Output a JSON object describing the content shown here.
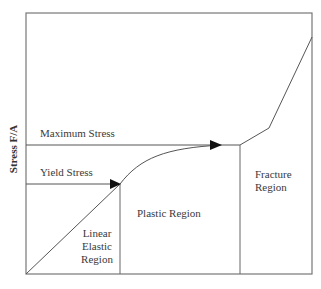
{
  "diagram": {
    "y_axis_label": "Stress  F/A",
    "labels": {
      "maximum_stress": "Maximum Stress",
      "yield_stress": "Yield Stress",
      "linear_elastic_region": [
        "Linear",
        "Elastic",
        "Region"
      ],
      "plastic_region": "Plastic Region",
      "fracture_region": [
        "Fracture",
        "Region"
      ]
    },
    "colors": {
      "line": "#555555",
      "arrow": "#111111",
      "text": "#3a3a3a"
    }
  }
}
